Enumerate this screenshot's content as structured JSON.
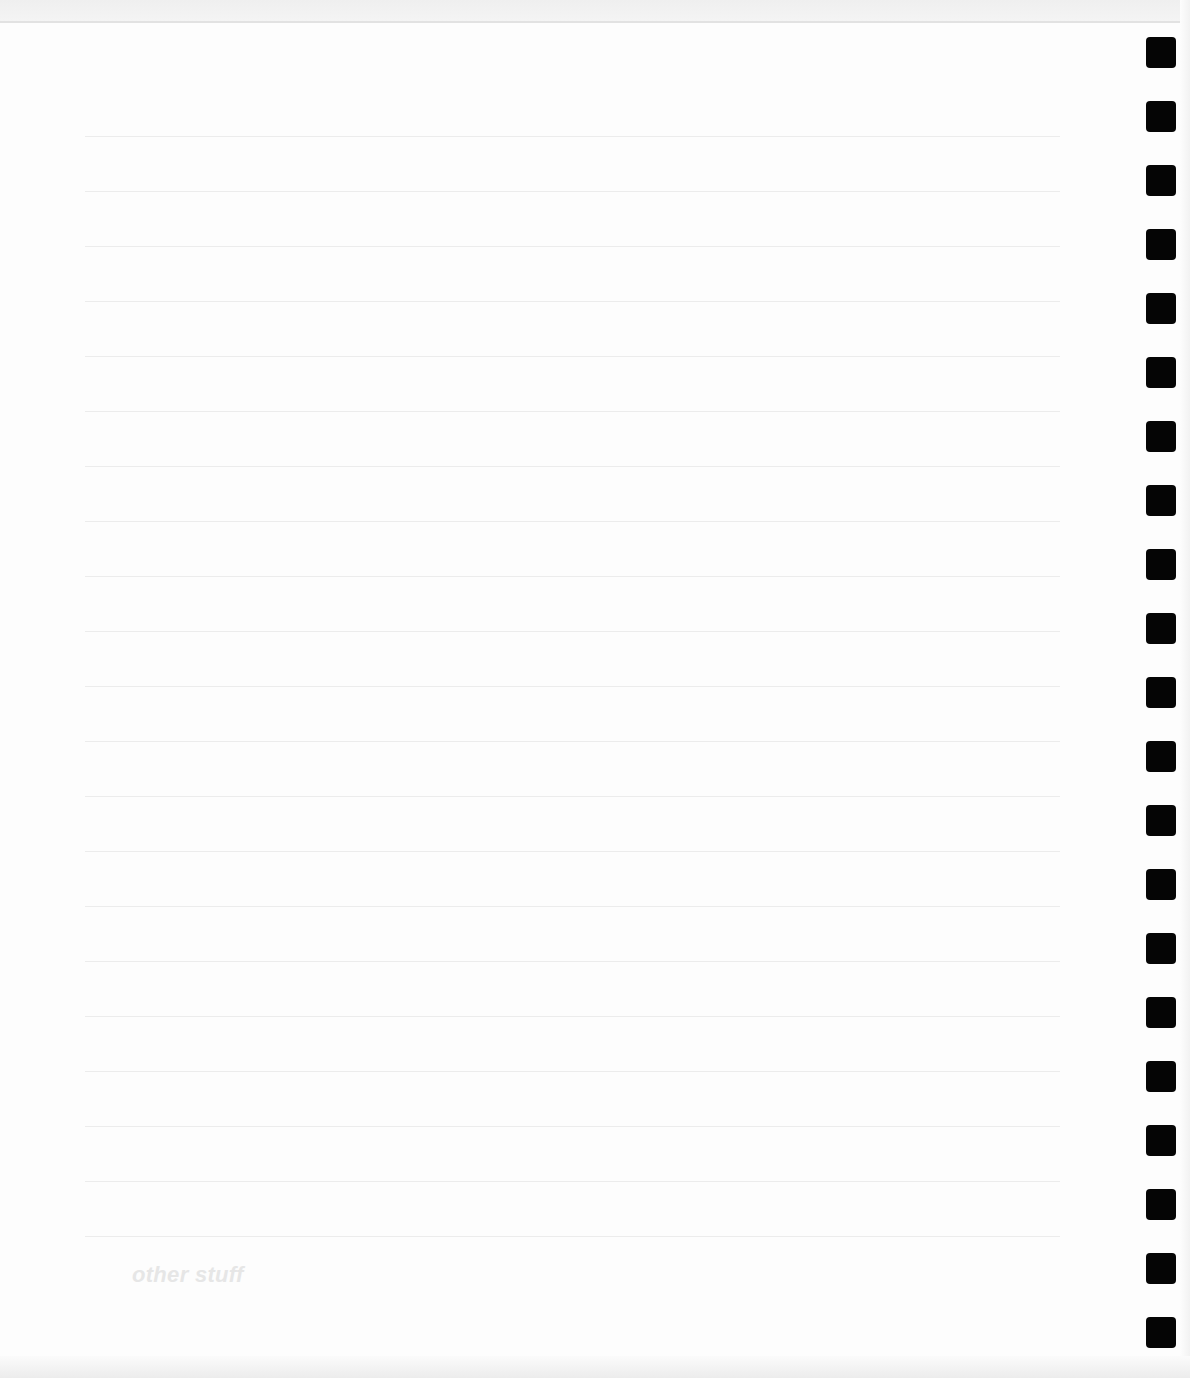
{
  "page": {
    "type": "ruled-notebook-page",
    "background_color": "#fdfdfd",
    "line_color": "#ececec",
    "hole_color": "#050505",
    "ruled_line_count": 21,
    "ruled_line_first_y": 136,
    "ruled_line_spacing": 55,
    "hole_count": 21,
    "hole_first_y": 37,
    "hole_spacing": 64
  },
  "footer": {
    "label": "other stuff",
    "label_color": "#e6e6e6"
  }
}
